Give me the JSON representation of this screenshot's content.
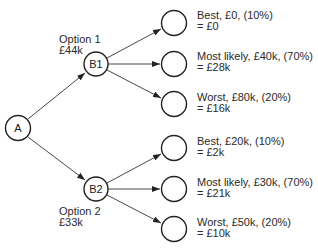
{
  "diagram": {
    "type": "decision-tree",
    "root": {
      "id": "A",
      "label": "A"
    },
    "options": [
      {
        "id": "B1",
        "label": "B1",
        "title": "Option 1",
        "value": "£44k",
        "outcomes": [
          {
            "line1": "Best, £0, (10%)",
            "line2": "= £0"
          },
          {
            "line1": "Most likely, £40k, (70%)",
            "line2": "= £28k"
          },
          {
            "line1": "Worst, £80k, (20%)",
            "line2": "= £16k"
          }
        ]
      },
      {
        "id": "B2",
        "label": "B2",
        "title": "Option 2",
        "value": "£33k",
        "outcomes": [
          {
            "line1": "Best, £20k, (10%)",
            "line2": "= £2k"
          },
          {
            "line1": "Most likely, £30k, (70%)",
            "line2": "= £21k"
          },
          {
            "line1": "Worst, £50k, (20%)",
            "line2": "= £10k"
          }
        ]
      }
    ]
  }
}
